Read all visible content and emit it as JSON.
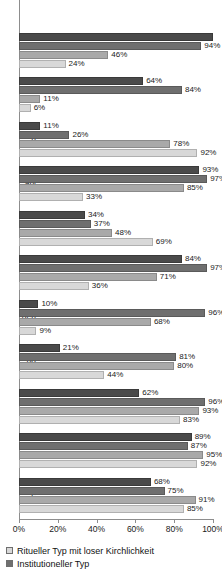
{
  "chart_data": {
    "type": "bar",
    "orientation": "horizontal",
    "title": "",
    "xlabel": "",
    "ylabel": "",
    "xlim": [
      0,
      100
    ],
    "xunit": "%",
    "grid": false,
    "legend_position": "bottom-left",
    "xticks": [
      "0%",
      "20%",
      "40%",
      "60%",
      "80%",
      "100%"
    ],
    "xtick_values": [
      0,
      20,
      40,
      60,
      80,
      100
    ],
    "series": [
      {
        "name": "",
        "key": "s0",
        "color": "#4a4a4a"
      },
      {
        "name": "Institutioneller Typ",
        "key": "s1",
        "color": "#6f6f6f"
      },
      {
        "name": "",
        "key": "s2",
        "color": "#a9a9a9"
      },
      {
        "name": "Ritueller Typ mit loser Kirchlichkeit",
        "key": "s3",
        "color": "#d8d8d8"
      }
    ],
    "categories": [
      "",
      "",
      "h",
      "ahl",
      "",
      "",
      "oen",
      "nd",
      "",
      "",
      "e"
    ],
    "groups": [
      {
        "label": "",
        "values": [
          100,
          94,
          46,
          24
        ],
        "labels": [
          "",
          "94%",
          "46%",
          "24%"
        ],
        "clipped_top": true
      },
      {
        "label": "",
        "values": [
          64,
          84,
          11,
          6
        ],
        "labels": [
          "64%",
          "84%",
          "11%",
          "6%"
        ]
      },
      {
        "label": "h",
        "values": [
          11,
          26,
          78,
          92
        ],
        "labels": [
          "11%",
          "26%",
          "78%",
          "92%"
        ]
      },
      {
        "label": "ahl",
        "values": [
          93,
          97,
          85,
          33
        ],
        "labels": [
          "93%",
          "97%",
          "85%",
          "33%"
        ]
      },
      {
        "label": "",
        "values": [
          34,
          37,
          48,
          69
        ],
        "labels": [
          "34%",
          "37%",
          "48%",
          "69%"
        ]
      },
      {
        "label": "",
        "values": [
          84,
          97,
          71,
          36
        ],
        "labels": [
          "84%",
          "97%",
          "71%",
          "36%"
        ]
      },
      {
        "label": "oen",
        "values": [
          10,
          96,
          68,
          9
        ],
        "labels": [
          "10%",
          "96%",
          "68%",
          "9%"
        ]
      },
      {
        "label": "nd",
        "values": [
          21,
          81,
          80,
          44
        ],
        "labels": [
          "21%",
          "81%",
          "80%",
          "44%"
        ]
      },
      {
        "label": "",
        "values": [
          62,
          96,
          93,
          83
        ],
        "labels": [
          "62%",
          "96%",
          "93%",
          "83%"
        ]
      },
      {
        "label": "",
        "values": [
          89,
          87,
          95,
          92
        ],
        "labels": [
          "89%",
          "87%",
          "95%",
          "92%"
        ]
      },
      {
        "label": "e",
        "values": [
          68,
          75,
          91,
          85
        ],
        "labels": [
          "68%",
          "75%",
          "91%",
          "85%"
        ]
      }
    ]
  },
  "legend": {
    "items": [
      {
        "label": "Ritueller Typ mit loser Kirchlichkeit",
        "color": "#d8d8d8"
      },
      {
        "label": "Institutioneller Typ",
        "color": "#6f6f6f"
      }
    ]
  }
}
